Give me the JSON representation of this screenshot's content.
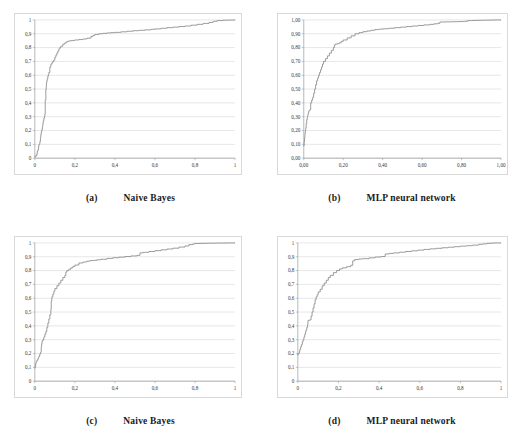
{
  "figure": {
    "background": "#ffffff",
    "curve_color": "#8a8a8a",
    "grid_color": "#c8c8cc",
    "axis_color": "#9a9a9a",
    "panel_count": 4
  },
  "panels": [
    {
      "id": "panel-a",
      "tag": "(a)",
      "title": "Naive Bayes",
      "chart_key": "a"
    },
    {
      "id": "panel-b",
      "tag": "(b)",
      "title": "MLP neural network",
      "chart_key": "b"
    },
    {
      "id": "panel-c",
      "tag": "(c)",
      "title": "Naive Bayes",
      "chart_key": "c"
    },
    {
      "id": "panel-d",
      "tag": "(d)",
      "title": "MLP neural network",
      "chart_key": "d"
    }
  ],
  "chart_data": [
    {
      "key": "a",
      "type": "line",
      "title": "Naive Bayes",
      "subtitle": "(a)",
      "xlabel": "",
      "ylabel": "",
      "xlim": [
        0,
        1
      ],
      "ylim": [
        0,
        1
      ],
      "grid": true,
      "legend": "none",
      "xticks": [
        0,
        0.2,
        0.4,
        0.6,
        0.8,
        1
      ],
      "xticklabels": [
        "0",
        "0,2",
        "0,4",
        "0,6",
        "0,8",
        "1"
      ],
      "yticks": [
        0,
        0.1,
        0.2,
        0.3,
        0.4,
        0.5,
        0.6,
        0.7,
        0.8,
        0.9,
        1
      ],
      "yticklabels": [
        "0",
        "0,1",
        "0,2",
        "0,3",
        "0,4",
        "0,5",
        "0,6",
        "0,7",
        "0,8",
        "0,9",
        "1"
      ],
      "series": [
        {
          "name": "ROC curve",
          "x": [
            0.0,
            0.005,
            0.01,
            0.012,
            0.015,
            0.018,
            0.02,
            0.022,
            0.025,
            0.028,
            0.03,
            0.032,
            0.035,
            0.038,
            0.04,
            0.042,
            0.045,
            0.048,
            0.05,
            0.052,
            0.055,
            0.057,
            0.058,
            0.06,
            0.062,
            0.065,
            0.068,
            0.07,
            0.075,
            0.08,
            0.085,
            0.09,
            0.095,
            0.1,
            0.105,
            0.11,
            0.115,
            0.12,
            0.125,
            0.13,
            0.14,
            0.15,
            0.16,
            0.17,
            0.18,
            0.19,
            0.2,
            0.22,
            0.24,
            0.26,
            0.28,
            0.29,
            0.3,
            0.32,
            0.34,
            0.36,
            0.38,
            0.4,
            0.43,
            0.46,
            0.49,
            0.52,
            0.55,
            0.58,
            0.6,
            0.63,
            0.66,
            0.69,
            0.72,
            0.75,
            0.78,
            0.81,
            0.84,
            0.87,
            0.89,
            0.91,
            0.94,
            0.97,
            1.0
          ],
          "y": [
            0.01,
            0.02,
            0.03,
            0.05,
            0.06,
            0.08,
            0.095,
            0.1,
            0.12,
            0.15,
            0.17,
            0.19,
            0.21,
            0.23,
            0.25,
            0.27,
            0.29,
            0.3,
            0.32,
            0.42,
            0.5,
            0.52,
            0.545,
            0.56,
            0.575,
            0.595,
            0.605,
            0.62,
            0.66,
            0.68,
            0.69,
            0.7,
            0.71,
            0.73,
            0.745,
            0.76,
            0.775,
            0.79,
            0.8,
            0.81,
            0.825,
            0.835,
            0.845,
            0.848,
            0.85,
            0.852,
            0.855,
            0.858,
            0.862,
            0.868,
            0.88,
            0.888,
            0.895,
            0.9,
            0.903,
            0.906,
            0.908,
            0.91,
            0.914,
            0.918,
            0.922,
            0.925,
            0.928,
            0.932,
            0.935,
            0.94,
            0.944,
            0.948,
            0.952,
            0.956,
            0.962,
            0.968,
            0.975,
            0.982,
            0.99,
            0.995,
            0.998,
            0.999,
            1.0
          ]
        }
      ]
    },
    {
      "key": "b",
      "type": "line",
      "title": "MLP neural network",
      "subtitle": "(b)",
      "xlabel": "",
      "ylabel": "",
      "xlim": [
        0,
        1
      ],
      "ylim": [
        0,
        1
      ],
      "grid": true,
      "legend": "none",
      "xticks": [
        0,
        0.2,
        0.4,
        0.6,
        0.8,
        1
      ],
      "xticklabels": [
        "0,00",
        "0,20",
        "0,40",
        "0,60",
        "0,80",
        "1,00"
      ],
      "yticks": [
        0,
        0.1,
        0.2,
        0.3,
        0.4,
        0.5,
        0.6,
        0.7,
        0.8,
        0.9,
        1
      ],
      "yticklabels": [
        "0,00",
        "0,10",
        "0,20",
        "0,30",
        "0,40",
        "0,50",
        "0,60",
        "0,70",
        "0,80",
        "0,90",
        "1,00"
      ],
      "series": [
        {
          "name": "ROC curve",
          "x": [
            0.0,
            0.002,
            0.004,
            0.006,
            0.008,
            0.01,
            0.012,
            0.015,
            0.018,
            0.02,
            0.022,
            0.025,
            0.028,
            0.03,
            0.035,
            0.04,
            0.045,
            0.05,
            0.055,
            0.06,
            0.065,
            0.07,
            0.075,
            0.08,
            0.085,
            0.09,
            0.095,
            0.1,
            0.11,
            0.12,
            0.13,
            0.14,
            0.15,
            0.155,
            0.16,
            0.17,
            0.18,
            0.19,
            0.2,
            0.22,
            0.24,
            0.26,
            0.28,
            0.3,
            0.32,
            0.34,
            0.36,
            0.38,
            0.4,
            0.43,
            0.46,
            0.49,
            0.52,
            0.55,
            0.58,
            0.61,
            0.64,
            0.66,
            0.68,
            0.69,
            0.72,
            0.75,
            0.78,
            0.81,
            0.83,
            0.85,
            0.88,
            0.91,
            0.94,
            0.97,
            1.0
          ],
          "y": [
            0.09,
            0.12,
            0.15,
            0.18,
            0.2,
            0.22,
            0.25,
            0.28,
            0.3,
            0.31,
            0.325,
            0.34,
            0.345,
            0.35,
            0.4,
            0.42,
            0.44,
            0.47,
            0.5,
            0.53,
            0.56,
            0.58,
            0.6,
            0.62,
            0.64,
            0.66,
            0.68,
            0.7,
            0.72,
            0.74,
            0.76,
            0.78,
            0.8,
            0.818,
            0.825,
            0.828,
            0.835,
            0.845,
            0.855,
            0.87,
            0.885,
            0.9,
            0.908,
            0.915,
            0.92,
            0.925,
            0.93,
            0.933,
            0.936,
            0.94,
            0.944,
            0.948,
            0.952,
            0.956,
            0.96,
            0.964,
            0.968,
            0.972,
            0.976,
            0.985,
            0.986,
            0.987,
            0.988,
            0.99,
            0.995,
            0.996,
            0.997,
            0.998,
            0.999,
            1.0,
            1.0
          ]
        }
      ]
    },
    {
      "key": "c",
      "type": "line",
      "title": "Naive Bayes",
      "subtitle": "(c)",
      "xlabel": "",
      "ylabel": "",
      "xlim": [
        0,
        1
      ],
      "ylim": [
        0,
        1
      ],
      "grid": true,
      "legend": "none",
      "xticks": [
        0,
        0.2,
        0.4,
        0.6,
        0.8,
        1
      ],
      "xticklabels": [
        "0",
        "0,2",
        "0,4",
        "0,6",
        "0,8",
        "1"
      ],
      "yticks": [
        0,
        0.1,
        0.2,
        0.3,
        0.4,
        0.5,
        0.6,
        0.7,
        0.8,
        0.9,
        1
      ],
      "yticklabels": [
        "0",
        "0,1",
        "0,2",
        "0,3",
        "0,4",
        "0,5",
        "0,6",
        "0,7",
        "0,8",
        "0,9",
        "1"
      ],
      "series": [
        {
          "name": "ROC curve",
          "x": [
            0.0,
            0.002,
            0.004,
            0.006,
            0.01,
            0.014,
            0.018,
            0.02,
            0.024,
            0.028,
            0.03,
            0.032,
            0.034,
            0.036,
            0.04,
            0.045,
            0.05,
            0.055,
            0.06,
            0.065,
            0.07,
            0.075,
            0.08,
            0.082,
            0.085,
            0.09,
            0.095,
            0.1,
            0.11,
            0.12,
            0.13,
            0.14,
            0.15,
            0.155,
            0.16,
            0.17,
            0.18,
            0.19,
            0.2,
            0.22,
            0.24,
            0.26,
            0.275,
            0.29,
            0.31,
            0.33,
            0.36,
            0.39,
            0.42,
            0.45,
            0.48,
            0.51,
            0.525,
            0.54,
            0.57,
            0.6,
            0.63,
            0.66,
            0.69,
            0.72,
            0.75,
            0.77,
            0.79,
            0.8,
            0.83,
            0.86,
            0.9,
            0.93,
            0.96,
            1.0
          ],
          "y": [
            0.095,
            0.11,
            0.125,
            0.14,
            0.15,
            0.16,
            0.17,
            0.18,
            0.195,
            0.205,
            0.21,
            0.25,
            0.27,
            0.29,
            0.3,
            0.32,
            0.34,
            0.36,
            0.39,
            0.42,
            0.45,
            0.48,
            0.52,
            0.58,
            0.61,
            0.63,
            0.65,
            0.67,
            0.69,
            0.71,
            0.73,
            0.75,
            0.765,
            0.79,
            0.8,
            0.81,
            0.82,
            0.83,
            0.84,
            0.855,
            0.862,
            0.868,
            0.872,
            0.874,
            0.878,
            0.882,
            0.888,
            0.893,
            0.897,
            0.902,
            0.906,
            0.91,
            0.928,
            0.932,
            0.938,
            0.944,
            0.95,
            0.956,
            0.962,
            0.97,
            0.978,
            0.988,
            0.993,
            0.996,
            0.997,
            0.998,
            0.999,
            0.999,
            1.0,
            1.0
          ]
        }
      ]
    },
    {
      "key": "d",
      "type": "line",
      "title": "MLP neural network",
      "subtitle": "(d)",
      "xlabel": "",
      "ylabel": "",
      "xlim": [
        0,
        1
      ],
      "ylim": [
        0,
        1
      ],
      "grid": true,
      "legend": "none",
      "xticks": [
        0,
        0.2,
        0.4,
        0.6,
        0.8,
        1
      ],
      "xticklabels": [
        "0",
        "0,2",
        "0,4",
        "0,6",
        "0,8",
        "1"
      ],
      "yticks": [
        0,
        0.1,
        0.2,
        0.3,
        0.4,
        0.5,
        0.6,
        0.7,
        0.8,
        0.9,
        1
      ],
      "yticklabels": [
        "0",
        "0,1",
        "0,2",
        "0,3",
        "0,4",
        "0,5",
        "0,6",
        "0,7",
        "0,8",
        "0,9",
        "1"
      ],
      "series": [
        {
          "name": "ROC curve",
          "x": [
            0.0,
            0.002,
            0.005,
            0.008,
            0.01,
            0.014,
            0.018,
            0.022,
            0.026,
            0.03,
            0.034,
            0.038,
            0.04,
            0.044,
            0.048,
            0.05,
            0.054,
            0.058,
            0.062,
            0.065,
            0.07,
            0.075,
            0.08,
            0.085,
            0.09,
            0.095,
            0.1,
            0.11,
            0.12,
            0.13,
            0.14,
            0.15,
            0.16,
            0.175,
            0.19,
            0.205,
            0.22,
            0.24,
            0.26,
            0.27,
            0.28,
            0.3,
            0.32,
            0.35,
            0.38,
            0.41,
            0.43,
            0.45,
            0.47,
            0.5,
            0.53,
            0.56,
            0.59,
            0.62,
            0.65,
            0.68,
            0.71,
            0.74,
            0.77,
            0.8,
            0.83,
            0.86,
            0.89,
            0.91,
            0.93,
            0.95,
            0.97,
            1.0
          ],
          "y": [
            0.19,
            0.195,
            0.205,
            0.215,
            0.23,
            0.25,
            0.265,
            0.285,
            0.3,
            0.32,
            0.34,
            0.355,
            0.37,
            0.39,
            0.41,
            0.44,
            0.441,
            0.442,
            0.443,
            0.47,
            0.5,
            0.53,
            0.56,
            0.59,
            0.61,
            0.625,
            0.645,
            0.665,
            0.69,
            0.71,
            0.73,
            0.75,
            0.765,
            0.785,
            0.8,
            0.812,
            0.82,
            0.828,
            0.838,
            0.87,
            0.88,
            0.884,
            0.886,
            0.892,
            0.898,
            0.902,
            0.92,
            0.924,
            0.928,
            0.933,
            0.938,
            0.943,
            0.948,
            0.953,
            0.957,
            0.961,
            0.965,
            0.969,
            0.973,
            0.977,
            0.98,
            0.984,
            0.99,
            0.993,
            0.997,
            0.999,
            1.0,
            1.0
          ]
        }
      ]
    }
  ]
}
